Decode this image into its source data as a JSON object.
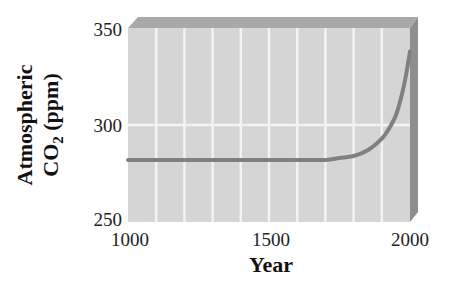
{
  "chart_data": {
    "type": "line",
    "title": "",
    "xlabel": "Year",
    "ylabel_line1": "Atmospheric",
    "ylabel_line2_prefix": "CO",
    "ylabel_line2_sub": "2",
    "ylabel_line2_suffix": " (ppm)",
    "ylabel": "Atmospheric CO2 (ppm)",
    "xlim": [
      1000,
      2000
    ],
    "ylim": [
      250,
      350
    ],
    "x_ticks": [
      1000,
      1500,
      2000
    ],
    "y_ticks": [
      250,
      300,
      350
    ],
    "grid": {
      "vertical_every": 100,
      "horizontal_at": [
        300
      ]
    },
    "series": [
      {
        "name": "Atmospheric CO2",
        "color": "#808080",
        "x": [
          1000,
          1100,
          1200,
          1300,
          1400,
          1500,
          1600,
          1700,
          1750,
          1800,
          1850,
          1900,
          1925,
          1950,
          1970,
          1985,
          2000
        ],
        "values": [
          282,
          282,
          282,
          282,
          282,
          282,
          282,
          282,
          283,
          284,
          287,
          293,
          298,
          305,
          315,
          325,
          338
        ]
      }
    ],
    "style": "3D panel with light gray face, darker top and right side edges"
  },
  "labels": {
    "x_tick_1000": "1000",
    "x_tick_1500": "1500",
    "x_tick_2000": "2000",
    "y_tick_250": "250",
    "y_tick_300": "300",
    "y_tick_350": "350",
    "x_title": "Year",
    "y_title_line1": "Atmospheric",
    "y_title_co": "CO",
    "y_title_sub": "2",
    "y_title_ppm": " (ppm)"
  },
  "colors": {
    "face": "#d4d4d4",
    "top": "#a8a8a8",
    "side": "#8f8f8f",
    "grid": "#f2f2f2",
    "line": "#7d7d7d"
  }
}
